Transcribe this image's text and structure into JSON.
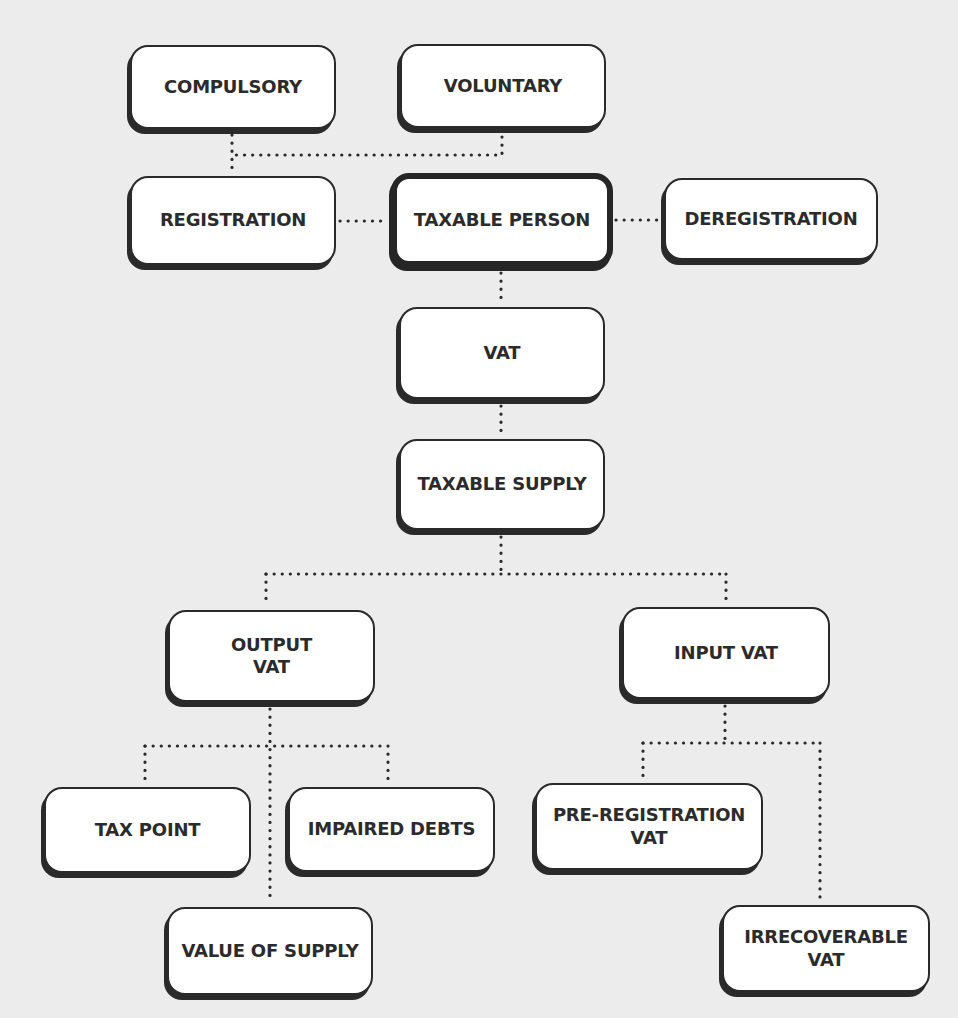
{
  "diagram": {
    "background_color": "#ececec",
    "box_border_color": "#2a2a2a",
    "text_color": "#2b2b2b",
    "nodes": [
      {
        "id": "compulsory",
        "label": "COMPULSORY"
      },
      {
        "id": "voluntary",
        "label": "VOLUNTARY"
      },
      {
        "id": "registration",
        "label": "REGISTRATION"
      },
      {
        "id": "taxable_person",
        "label": "TAXABLE PERSON"
      },
      {
        "id": "deregistration",
        "label": "DEREGISTRATION"
      },
      {
        "id": "vat",
        "label": "VAT"
      },
      {
        "id": "taxable_supply",
        "label": "TAXABLE SUPPLY"
      },
      {
        "id": "output_vat",
        "label": "OUTPUT\nVAT"
      },
      {
        "id": "input_vat",
        "label": "INPUT VAT"
      },
      {
        "id": "tax_point",
        "label": "TAX POINT"
      },
      {
        "id": "impaired_debts",
        "label": "IMPAIRED DEBTS"
      },
      {
        "id": "pre_registration_vat",
        "label": "PRE-REGISTRATION\nVAT"
      },
      {
        "id": "value_of_supply",
        "label": "VALUE OF SUPPLY"
      },
      {
        "id": "irrecoverable_vat",
        "label": "IRRECOVERABLE\nVAT"
      }
    ],
    "edges": [
      {
        "from": "compulsory",
        "to": "registration"
      },
      {
        "from": "voluntary",
        "to": "registration"
      },
      {
        "from": "registration",
        "to": "taxable_person"
      },
      {
        "from": "taxable_person",
        "to": "deregistration"
      },
      {
        "from": "taxable_person",
        "to": "vat"
      },
      {
        "from": "vat",
        "to": "taxable_supply"
      },
      {
        "from": "taxable_supply",
        "to": "output_vat"
      },
      {
        "from": "taxable_supply",
        "to": "input_vat"
      },
      {
        "from": "output_vat",
        "to": "tax_point"
      },
      {
        "from": "output_vat",
        "to": "impaired_debts"
      },
      {
        "from": "output_vat",
        "to": "value_of_supply"
      },
      {
        "from": "input_vat",
        "to": "pre_registration_vat"
      },
      {
        "from": "input_vat",
        "to": "irrecoverable_vat"
      }
    ]
  }
}
